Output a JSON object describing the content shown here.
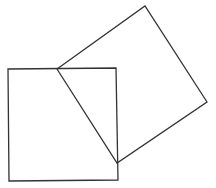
{
  "diagram": {
    "stroke_color": "#333333",
    "stroke_width": 1.3,
    "shapes": [
      {
        "id": "square-upright",
        "points": [
          [
            8,
            69
          ],
          [
            116,
            68
          ],
          [
            118,
            180
          ],
          [
            9,
            181
          ]
        ]
      },
      {
        "id": "square-tilted",
        "points": [
          [
            57,
            69
          ],
          [
            145,
            6
          ],
          [
            207,
            102
          ],
          [
            117,
            163
          ]
        ]
      }
    ]
  }
}
